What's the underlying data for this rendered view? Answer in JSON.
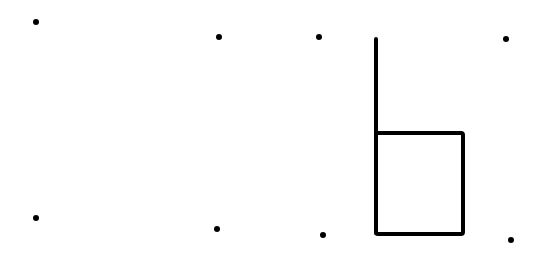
{
  "diagram": {
    "background": "#ffffff",
    "ink": "#000000",
    "dots": [
      {
        "x": 36,
        "y": 22
      },
      {
        "x": 219,
        "y": 37
      },
      {
        "x": 319,
        "y": 37
      },
      {
        "x": 506,
        "y": 39
      },
      {
        "x": 36,
        "y": 218
      },
      {
        "x": 217,
        "y": 229
      },
      {
        "x": 323,
        "y": 235
      },
      {
        "x": 511,
        "y": 240
      }
    ],
    "stem": {
      "x": 376,
      "y1": 39,
      "y2": 233
    },
    "box": {
      "x": 376,
      "y": 133,
      "width": 87,
      "height": 101
    }
  }
}
